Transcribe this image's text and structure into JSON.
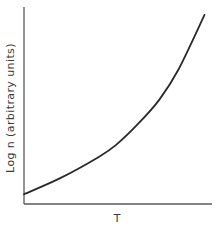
{
  "chart_data": {
    "type": "line",
    "title": "",
    "xlabel": "T",
    "ylabel": "Log n (arbitrary units)",
    "grid": false,
    "legend": null,
    "x_ticks": [],
    "y_ticks": [],
    "xlim": [
      0,
      1
    ],
    "ylim": [
      0,
      1
    ],
    "series": [
      {
        "name": "Log n vs T",
        "x": [
          0.0,
          0.19,
          0.4,
          0.49,
          0.61,
          0.72,
          0.82,
          0.96
        ],
        "y": [
          0.05,
          0.13,
          0.24,
          0.3,
          0.41,
          0.53,
          0.68,
          0.96
        ]
      }
    ]
  },
  "axes": {
    "x_label": "T",
    "y_label": "Log n (arbitrary units)"
  }
}
